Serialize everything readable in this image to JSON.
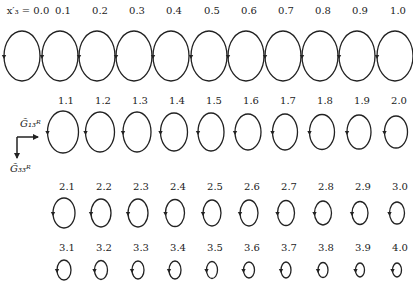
{
  "figure": {
    "first_label_prefix": "x′₃ = ",
    "axes": {
      "horizontal_label": "G̃₁₃ᴿ",
      "vertical_label": "G̃₃₃ᴿ"
    },
    "stroke_color": "#222222"
  },
  "rows": [
    {
      "label_y": 14,
      "cy": 56,
      "rx": 18,
      "ry": 25,
      "items": [
        {
          "label": "0.0",
          "cx": 22
        },
        {
          "label": "0.1",
          "cx": 60
        },
        {
          "label": "0.2",
          "cx": 97
        },
        {
          "label": "0.3",
          "cx": 134
        },
        {
          "label": "0.4",
          "cx": 171
        },
        {
          "label": "0.5",
          "cx": 209
        },
        {
          "label": "0.6",
          "cx": 246
        },
        {
          "label": "0.7",
          "cx": 283
        },
        {
          "label": "0.8",
          "cx": 320
        },
        {
          "label": "0.9",
          "cx": 357
        },
        {
          "label": "1.0",
          "cx": 395
        }
      ]
    },
    {
      "label_y": 104,
      "cy": 132,
      "rx": 15,
      "ry": 20,
      "items": [
        {
          "label": "1.1",
          "cx": 63,
          "rx": 15.5,
          "ry": 21
        },
        {
          "label": "1.2",
          "cx": 100,
          "rx": 14.5,
          "ry": 20
        },
        {
          "label": "1.3",
          "cx": 137,
          "rx": 14,
          "ry": 20
        },
        {
          "label": "1.4",
          "cx": 174,
          "rx": 13.5,
          "ry": 19
        },
        {
          "label": "1.5",
          "cx": 211,
          "rx": 13,
          "ry": 19
        },
        {
          "label": "1.6",
          "cx": 248,
          "rx": 13,
          "ry": 18
        },
        {
          "label": "1.7",
          "cx": 285,
          "rx": 12.5,
          "ry": 18
        },
        {
          "label": "1.8",
          "cx": 322,
          "rx": 12.5,
          "ry": 17.5
        },
        {
          "label": "1.9",
          "cx": 359,
          "rx": 12,
          "ry": 17
        },
        {
          "label": "2.0",
          "cx": 396,
          "rx": 11.5,
          "ry": 16
        }
      ]
    },
    {
      "label_y": 190,
      "cy": 213,
      "rx": 10,
      "ry": 13,
      "items": [
        {
          "label": "2.1",
          "cx": 64,
          "rx": 11,
          "ry": 15
        },
        {
          "label": "2.2",
          "cx": 101,
          "rx": 10,
          "ry": 14
        },
        {
          "label": "2.3",
          "cx": 138,
          "rx": 10,
          "ry": 14
        },
        {
          "label": "2.4",
          "cx": 175,
          "rx": 9.5,
          "ry": 13.5
        },
        {
          "label": "2.5",
          "cx": 212,
          "rx": 9,
          "ry": 13
        },
        {
          "label": "2.6",
          "cx": 249,
          "rx": 9,
          "ry": 13
        },
        {
          "label": "2.7",
          "cx": 286,
          "rx": 8.5,
          "ry": 12.5
        },
        {
          "label": "2.8",
          "cx": 323,
          "rx": 8.5,
          "ry": 12
        },
        {
          "label": "2.9",
          "cx": 360,
          "rx": 8,
          "ry": 11.5
        },
        {
          "label": "3.0",
          "cx": 397,
          "rx": 7.5,
          "ry": 11
        }
      ]
    },
    {
      "label_y": 251,
      "cy": 270,
      "rx": 6,
      "ry": 8,
      "items": [
        {
          "label": "3.1",
          "cx": 64,
          "rx": 7,
          "ry": 10
        },
        {
          "label": "3.2",
          "cx": 101,
          "rx": 6.5,
          "ry": 9.5
        },
        {
          "label": "3.3",
          "cx": 138,
          "rx": 6,
          "ry": 9
        },
        {
          "label": "3.4",
          "cx": 175,
          "rx": 6,
          "ry": 9
        },
        {
          "label": "3.5",
          "cx": 212,
          "rx": 5.5,
          "ry": 8.5
        },
        {
          "label": "3.6",
          "cx": 249,
          "rx": 5.5,
          "ry": 8
        },
        {
          "label": "3.7",
          "cx": 286,
          "rx": 5,
          "ry": 8
        },
        {
          "label": "3.8",
          "cx": 323,
          "rx": 5,
          "ry": 7.5
        },
        {
          "label": "3.9",
          "cx": 360,
          "rx": 4.5,
          "ry": 7
        },
        {
          "label": "4.0",
          "cx": 397,
          "rx": 4.5,
          "ry": 7
        }
      ]
    }
  ]
}
